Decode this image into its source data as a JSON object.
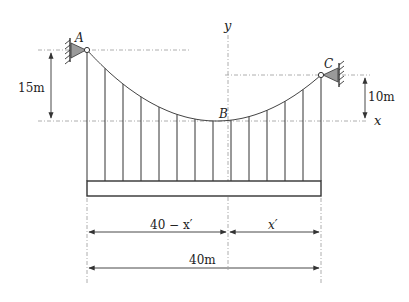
{
  "diagram": {
    "points": {
      "A": "A",
      "B": "B",
      "C": "C"
    },
    "axes": {
      "x": "x",
      "y": "y"
    },
    "dimensions": {
      "left_height": "15m",
      "right_height": "10m",
      "left_span": "40 − x′",
      "right_span": "x′",
      "total_span": "40m"
    },
    "hanger_count": 14,
    "colors": {
      "line": "#333333",
      "guide": "#888888",
      "support_fill": "#9a9a9a"
    }
  }
}
